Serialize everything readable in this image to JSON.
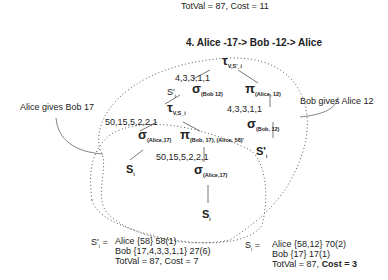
{
  "top_summary": {
    "line": "TotVal = 87, Cost = 11"
  },
  "title": "4.  Alice -17-> Bob -12-> Alice",
  "annotations": {
    "left": "Alice gives Bob 17",
    "right": "Bob gives Alice 12"
  },
  "outer_tree": {
    "root": {
      "symbol": "τ",
      "sub": "V,S'_i"
    },
    "edge_label": "4,3,3,1,1",
    "s_prime_label": "S'",
    "s_prime_sub": "i",
    "sigma": {
      "symbol": "σ",
      "sub": "(Bob 12)"
    },
    "pi": {
      "symbol": "π",
      "sub": "(Alice, 12)"
    },
    "pi_edge_label": "4,3,3,1,1",
    "sigma2": {
      "symbol": "σ",
      "sub": "(Bob, 12)"
    },
    "leaf": {
      "label": "S'",
      "sub": "i"
    }
  },
  "inner_tree": {
    "root": {
      "symbol": "τ",
      "sub": "V,S_i"
    },
    "edge_label": "50,15,5,2,2,1",
    "sigma": {
      "symbol": "σ",
      "sub": "(Alice,17)"
    },
    "pi": {
      "symbol": "π",
      "sub": "(Bob, 17), (Alice, 58)'"
    },
    "pi_edge_label": "50,15,5,2,2,1",
    "leaf_left": {
      "label": "S",
      "sub": "i"
    },
    "sigma2": {
      "symbol": "σ",
      "sub": "(Alice,17)"
    },
    "leaf_bottom": {
      "label": "S",
      "sub": "i"
    }
  },
  "results": {
    "left": {
      "label": "S'",
      "sub": "i",
      "eq": "=",
      "lines": [
        "Alice {58} 58(1)",
        "Bob {17,4,3,3,1,1} 27(6)",
        "TotVal = 87, Cost = 7"
      ]
    },
    "right": {
      "label": "S",
      "sub": "i",
      "eq": "=",
      "lines": [
        "Alice {58,12} 70(2)",
        "Bob {17} 17(1)"
      ],
      "totval": "TotVal = 87, ",
      "cost": "Cost = 3"
    }
  }
}
